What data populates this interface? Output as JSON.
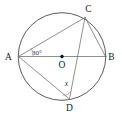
{
  "figure": {
    "shape": "circle",
    "center_label": "O",
    "points": [
      {
        "id": "A",
        "label": "A",
        "x": 18.5,
        "y": 56.5,
        "label_x": 8.5,
        "label_y": 60.0
      },
      {
        "id": "B",
        "label": "B",
        "x": 105.5,
        "y": 56.5,
        "label_x": 111.5,
        "label_y": 60.0
      },
      {
        "id": "C",
        "label": "C",
        "x": 85.0,
        "y": 17.5,
        "label_x": 88.5,
        "label_y": 11.5
      },
      {
        "id": "D",
        "label": "D",
        "x": 69.5,
        "y": 99.0,
        "label_x": 69.5,
        "label_y": 111.0
      },
      {
        "id": "O",
        "label": "O",
        "x": 62.0,
        "y": 56.5,
        "label_x": 62.0,
        "label_y": 68.0
      }
    ],
    "circle": {
      "cx": 62.0,
      "cy": 56.5,
      "r": 43.8
    },
    "segments": [
      {
        "name": "chord-AC",
        "from": "A",
        "to": "C"
      },
      {
        "name": "diameter-AB",
        "from": "A",
        "to": "B"
      },
      {
        "name": "chord-AD",
        "from": "A",
        "to": "D"
      },
      {
        "name": "chord-CB",
        "from": "C",
        "to": "B"
      },
      {
        "name": "chord-CD",
        "from": "C",
        "to": "D"
      }
    ],
    "angles": [
      {
        "name": "angle-at-A",
        "vertex": "A",
        "value": "30°",
        "label_x": 32.0,
        "label_y": 54.5,
        "between": [
          "AC",
          "AB"
        ]
      },
      {
        "name": "angle-at-D",
        "vertex": "D",
        "value": "x",
        "label_x": 66.5,
        "label_y": 86.0,
        "between": [
          "DA",
          "DC"
        ]
      }
    ],
    "colors": {
      "circle_stroke": "#4a4a4a",
      "chord_stroke": "#6b6b6b",
      "angle_mark_stroke": "#8a8a8a",
      "label_fill": "#1a1a1a",
      "point_dot_fill": "#111111",
      "background": "#ffffff"
    }
  }
}
